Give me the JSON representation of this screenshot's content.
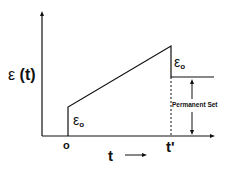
{
  "diagram": {
    "y_axis_label": {
      "symbol": "ε",
      "arg": "(t)"
    },
    "origin_label": "o",
    "x_axis_label": {
      "symbol": "t",
      "arrow": "⟶"
    },
    "release_time_label": "t'",
    "instant_strain_label_1": {
      "symbol": "ε",
      "sub": "o"
    },
    "instant_strain_label_2": {
      "symbol": "ε",
      "sub": "o"
    },
    "annotation": "Permanent Set",
    "colors": {
      "line": "#111111",
      "background": "#ffffff"
    }
  }
}
